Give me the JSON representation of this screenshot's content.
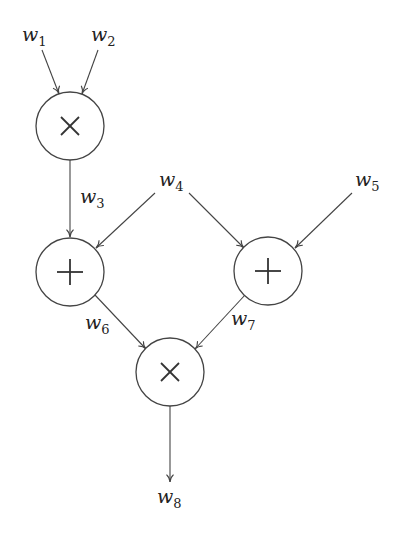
{
  "diagram": {
    "type": "computational-graph",
    "variables": [
      {
        "id": "w1",
        "base": "w",
        "sub": "1"
      },
      {
        "id": "w2",
        "base": "w",
        "sub": "2"
      },
      {
        "id": "w3",
        "base": "w",
        "sub": "3"
      },
      {
        "id": "w4",
        "base": "w",
        "sub": "4"
      },
      {
        "id": "w5",
        "base": "w",
        "sub": "5"
      },
      {
        "id": "w6",
        "base": "w",
        "sub": "6"
      },
      {
        "id": "w7",
        "base": "w",
        "sub": "7"
      },
      {
        "id": "w8",
        "base": "w",
        "sub": "8"
      }
    ],
    "operations": [
      {
        "id": "mul1",
        "symbol": "×",
        "inputs": [
          "w1",
          "w2"
        ],
        "output": "w3"
      },
      {
        "id": "add1",
        "symbol": "+",
        "inputs": [
          "w3",
          "w4"
        ],
        "output": "w6"
      },
      {
        "id": "add2",
        "symbol": "+",
        "inputs": [
          "w4",
          "w5"
        ],
        "output": "w7"
      },
      {
        "id": "mul2",
        "symbol": "×",
        "inputs": [
          "w6",
          "w7"
        ],
        "output": "w8"
      }
    ]
  }
}
